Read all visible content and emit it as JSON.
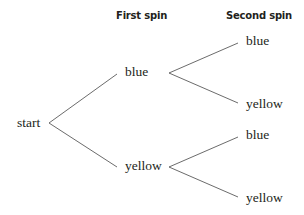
{
  "headers": {
    "first_spin": "First spin",
    "second_spin": "Second spin"
  },
  "tree": {
    "root": "start",
    "level1": [
      {
        "label": "blue",
        "children": [
          "blue",
          "yellow"
        ]
      },
      {
        "label": "yellow",
        "children": [
          "blue",
          "yellow"
        ]
      }
    ]
  },
  "colors": {
    "text": "#231f20",
    "lines": "#5a5a5a",
    "background": "#ffffff"
  }
}
